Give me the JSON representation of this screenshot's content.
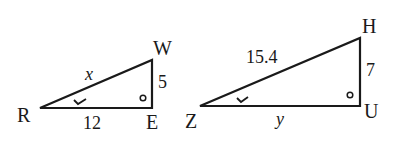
{
  "triangles": [
    {
      "id": "triangle-REW",
      "vertices": {
        "R": "R",
        "E": "E",
        "W": "W"
      },
      "sides": {
        "hypotenuse": "x",
        "base": "12",
        "height": "5"
      },
      "right_angle_at": "E",
      "marked_angle_at": "R"
    },
    {
      "id": "triangle-ZUH",
      "vertices": {
        "Z": "Z",
        "U": "U",
        "H": "H"
      },
      "sides": {
        "hypotenuse": "15.4",
        "base": "y",
        "height": "7"
      },
      "right_angle_at": "U",
      "marked_angle_at": "Z"
    }
  ],
  "colors": {
    "stroke": "#1a1a1a",
    "background": "#ffffff"
  }
}
